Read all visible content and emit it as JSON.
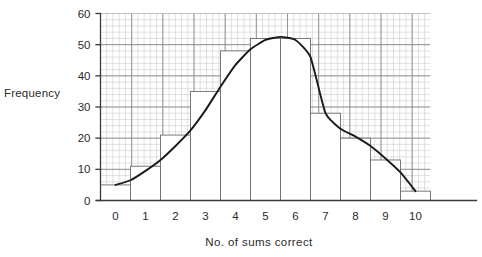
{
  "chart_data": {
    "type": "bar",
    "title": "",
    "subtitle": "",
    "xlabel": "No. of sums correct",
    "ylabel": "Frequency",
    "categories": [
      "0",
      "1",
      "2",
      "3",
      "4",
      "5",
      "6",
      "7",
      "8",
      "9",
      "10"
    ],
    "values": [
      5,
      11,
      21,
      35,
      48,
      52,
      52,
      28,
      20,
      13,
      3
    ],
    "series": [
      {
        "name": "Frequency",
        "type": "bar",
        "values": [
          5,
          11,
          21,
          35,
          48,
          52,
          52,
          28,
          20,
          13,
          3
        ]
      },
      {
        "name": "Frequency curve",
        "type": "line",
        "x": [
          0,
          0.5,
          1,
          1.5,
          2,
          2.5,
          3,
          3.5,
          4,
          4.5,
          5,
          5.5,
          6,
          6.5,
          7,
          7.5,
          8,
          8.5,
          9,
          9.5,
          10
        ],
        "values": [
          5,
          6.5,
          9.5,
          13,
          17.5,
          22.5,
          29,
          36.5,
          43.5,
          48.5,
          51.5,
          52.5,
          51.5,
          46,
          28,
          23,
          20.5,
          17.5,
          13.5,
          9,
          3
        ]
      }
    ],
    "xlim": [
      -0.5,
      10.5
    ],
    "ylim": [
      0,
      60
    ],
    "ytick_labels": [
      "0",
      "10",
      "20",
      "30",
      "40",
      "50",
      "60"
    ],
    "ytick_values": [
      0,
      10,
      20,
      30,
      40,
      50,
      60
    ],
    "xtick_labels": [
      "0",
      "1",
      "2",
      "3",
      "4",
      "5",
      "6",
      "7",
      "8",
      "9",
      "10"
    ],
    "xtick_values": [
      0,
      1,
      2,
      3,
      4,
      5,
      6,
      7,
      8,
      9,
      10
    ],
    "grid": true,
    "grid_minor": true,
    "grid_minor_step_y": 2,
    "grid_major_step_y": 10,
    "legend": false,
    "legend_position": "none",
    "bar_fill": "#ffffff",
    "bar_edge": "#6b6b6b",
    "curve_color": "#1a1a1a",
    "grid_major_color": "#8a8a8a",
    "grid_minor_color": "#c2c2c2",
    "axis_color": "#3a3a3a",
    "background": "#ffffff"
  }
}
